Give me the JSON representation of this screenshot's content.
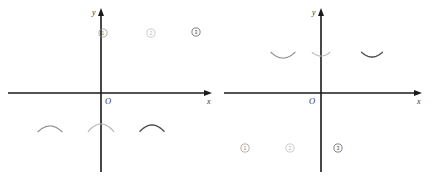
{
  "figure": {
    "background_color": "#ffffff",
    "axis_color": "#1a1a1a",
    "panels": [
      {
        "id": "left",
        "name": "upward-parabolas-panel",
        "origin_label": "O",
        "x_axis_label": "x",
        "y_axis_label": "y",
        "curves": [
          {
            "tag": "①",
            "label_text": "1",
            "color": "#8c8c8c",
            "stroke_width": 1.15,
            "direction": "up",
            "vertex_x": 50,
            "vertex_y": 126,
            "a": 0.04,
            "tag_x": 103,
            "tag_y": 33
          },
          {
            "tag": "②",
            "label_text": "2",
            "color": "#b8b8b8",
            "stroke_width": 1.15,
            "direction": "up",
            "vertex_x": 101,
            "vertex_y": 124,
            "a": 0.046,
            "tag_x": 151,
            "tag_y": 33
          },
          {
            "tag": "③",
            "label_text": "3",
            "color": "#4a4a4a",
            "stroke_width": 1.35,
            "direction": "up",
            "vertex_x": 152,
            "vertex_y": 125,
            "a": 0.044,
            "tag_x": 196,
            "tag_y": 32
          }
        ]
      },
      {
        "id": "right",
        "name": "downward-parabolas-panel",
        "origin_label": "O",
        "x_axis_label": "x",
        "y_axis_label": "y",
        "curves": [
          {
            "tag": "①",
            "label_text": "1",
            "color": "#8c8c8c",
            "stroke_width": 1.15,
            "direction": "down",
            "vertex_x": 65,
            "vertex_y": 58,
            "a": 0.04,
            "tag_x": 27,
            "tag_y": 148
          },
          {
            "tag": "②",
            "label_text": "2",
            "color": "#b8b8b8",
            "stroke_width": 1.15,
            "direction": "down",
            "vertex_x": 103,
            "vertex_y": 56,
            "a": 0.046,
            "tag_x": 72,
            "tag_y": 148
          },
          {
            "tag": "③",
            "label_text": "3",
            "color": "#4a4a4a",
            "stroke_width": 1.35,
            "direction": "down",
            "vertex_x": 154,
            "vertex_y": 57,
            "a": 0.044,
            "tag_x": 120,
            "tag_y": 148
          }
        ]
      }
    ]
  },
  "chart_data": {
    "type": "line",
    "title": "",
    "xlabel": "x",
    "ylabel": "y",
    "grid": false,
    "legend": "none",
    "panels": [
      {
        "name": "left-plane",
        "opening": "upward",
        "axes": {
          "x_axis_label": "x",
          "y_axis_label": "y",
          "origin_label": "O"
        },
        "series": [
          {
            "name": "①",
            "vertex": [
              -5.1,
              -3.3
            ],
            "opens": "up",
            "roots_approx": [
              -8.0,
              -2.2
            ]
          },
          {
            "name": "②",
            "vertex": [
              -0.0,
              -3.1
            ],
            "opens": "up",
            "roots_approx": [
              -2.6,
              2.6
            ]
          },
          {
            "name": "③",
            "vertex": [
              5.1,
              -3.2
            ],
            "opens": "up",
            "roots_approx": [
              2.4,
              7.8
            ]
          }
        ]
      },
      {
        "name": "right-plane",
        "opening": "downward",
        "axes": {
          "x_axis_label": "x",
          "y_axis_label": "y",
          "origin_label": "O"
        },
        "series": [
          {
            "name": "①",
            "vertex": [
              -5.5,
              3.5
            ],
            "opens": "down",
            "roots_approx": [
              -8.4,
              -2.6
            ]
          },
          {
            "name": "②",
            "vertex": [
              -1.7,
              3.7
            ],
            "opens": "down",
            "roots_approx": [
              -4.5,
              1.1
            ]
          },
          {
            "name": "③",
            "vertex": [
              3.4,
              3.6
            ],
            "opens": "down",
            "roots_approx": [
              0.6,
              6.2
            ]
          }
        ]
      }
    ]
  }
}
